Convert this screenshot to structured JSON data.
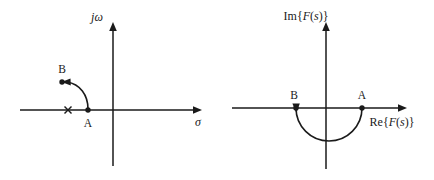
{
  "figure": {
    "caption": "",
    "panels": [
      {
        "id": "s-plane",
        "name": "s-plane",
        "axes": {
          "vertical_label": "jω",
          "vertical_label_parts": {
            "j": "j",
            "omega": "ω"
          },
          "horizontal_label": "σ"
        },
        "points": [
          {
            "id": "A",
            "label": "A",
            "marker": "filled-dot",
            "x_px": 88,
            "y_px": 110
          },
          {
            "id": "B",
            "label": "B",
            "marker": "filled-dot-with-arrowhead",
            "x_px": 62,
            "y_px": 82
          }
        ],
        "markers": [
          {
            "id": "pole",
            "label": "",
            "marker": "x-cross",
            "x_px": 68,
            "y_px": 110
          }
        ],
        "path": {
          "type": "quarter-arc",
          "from": "A",
          "to": "B",
          "direction": "counterclockwise",
          "arrow_at": "B"
        }
      },
      {
        "id": "f-plane",
        "name": "F(s)-plane",
        "axes": {
          "vertical_label": "Im{F(s)}",
          "vertical_label_parts": {
            "prefix": "Im{",
            "func": "F",
            "arg_open": "(",
            "arg": "s",
            "arg_close": ")",
            "suffix": "}"
          },
          "horizontal_label": "Re{F(s)}",
          "horizontal_label_parts": {
            "prefix": "Re{",
            "func": "F",
            "arg_open": "(",
            "arg": "s",
            "arg_close": ")",
            "suffix": "}"
          }
        },
        "points": [
          {
            "id": "A",
            "label": "A",
            "marker": "filled-dot",
            "x_px": 362,
            "y_px": 108
          },
          {
            "id": "B",
            "label": "B",
            "marker": "filled-dot-with-arrowhead",
            "x_px": 296,
            "y_px": 108
          }
        ],
        "path": {
          "type": "semicircle",
          "from": "A",
          "to": "B",
          "half": "lower",
          "direction": "clockwise-through-lower-half",
          "arrow_at": "B"
        }
      }
    ]
  },
  "colors": {
    "ink": "#1a1a1a",
    "background": "#ffffff"
  }
}
